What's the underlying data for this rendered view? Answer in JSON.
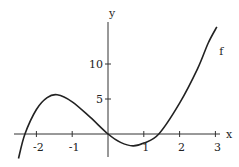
{
  "chart_data": {
    "type": "line",
    "title": "",
    "xlabel": "x",
    "ylabel": "y",
    "xlim": [
      -2.6,
      3.15
    ],
    "ylim": [
      -3.7,
      16.5
    ],
    "grid": false,
    "x_ticks": [
      -2,
      -1,
      0,
      1,
      2,
      3
    ],
    "x_tick_labels": [
      "-2",
      "-1",
      "",
      "1",
      "2",
      "3"
    ],
    "y_ticks": [
      5,
      10
    ],
    "y_tick_labels": [
      "5",
      "10"
    ],
    "series": [
      {
        "name": "f",
        "x": [
          -2.5,
          -2.32,
          -2.0,
          -1.7,
          -1.42,
          -1.0,
          -0.5,
          0.0,
          0.35,
          0.7,
          1.0,
          1.42,
          2.0,
          2.5,
          2.8,
          3.04
        ],
        "y": [
          -3.5,
          0.0,
          3.5,
          5.2,
          5.6,
          4.6,
          2.4,
          0.0,
          -1.2,
          -1.7,
          -1.3,
          0.0,
          4.4,
          9.3,
          13.0,
          15.3
        ]
      }
    ],
    "annotations": [
      {
        "text": "f",
        "x": 3.0,
        "y": 11.2
      }
    ]
  }
}
